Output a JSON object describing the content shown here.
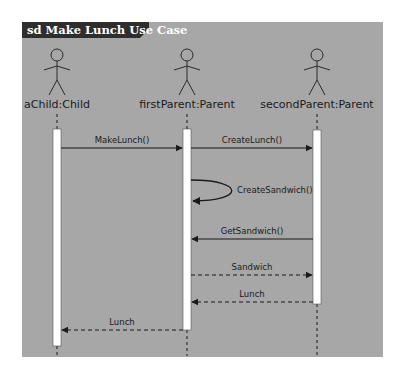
{
  "diagram": {
    "title": "sd Make Lunch Use Case",
    "colors": {
      "frame_bg": "#a7a7a7",
      "title_bg": "#2e2e2e",
      "title_text": "#ffffff",
      "activation_fill": "#ffffff",
      "line": "#1a1a1a"
    },
    "actors": [
      {
        "id": "child",
        "label": "aChild:Child",
        "x": 57
      },
      {
        "id": "first",
        "label": "firstParent:Parent",
        "x": 187
      },
      {
        "id": "second",
        "label": "secondParent:Parent",
        "x": 317
      }
    ],
    "messages": [
      {
        "label": "MakeLunch()",
        "from": "aChild:Child",
        "to": "firstParent:Parent",
        "type": "sync"
      },
      {
        "label": "CreateLunch()",
        "from": "firstParent:Parent",
        "to": "secondParent:Parent",
        "type": "sync"
      },
      {
        "label": "CreateSandwich()",
        "from": "firstParent:Parent",
        "to": "firstParent:Parent",
        "type": "self"
      },
      {
        "label": "GetSandwich()",
        "from": "secondParent:Parent",
        "to": "firstParent:Parent",
        "type": "sync"
      },
      {
        "label": "Sandwich",
        "from": "firstParent:Parent",
        "to": "secondParent:Parent",
        "type": "return"
      },
      {
        "label": "Lunch",
        "from": "secondParent:Parent",
        "to": "firstParent:Parent",
        "type": "return"
      },
      {
        "label": "Lunch",
        "from": "firstParent:Parent",
        "to": "aChild:Child",
        "type": "return"
      }
    ]
  }
}
